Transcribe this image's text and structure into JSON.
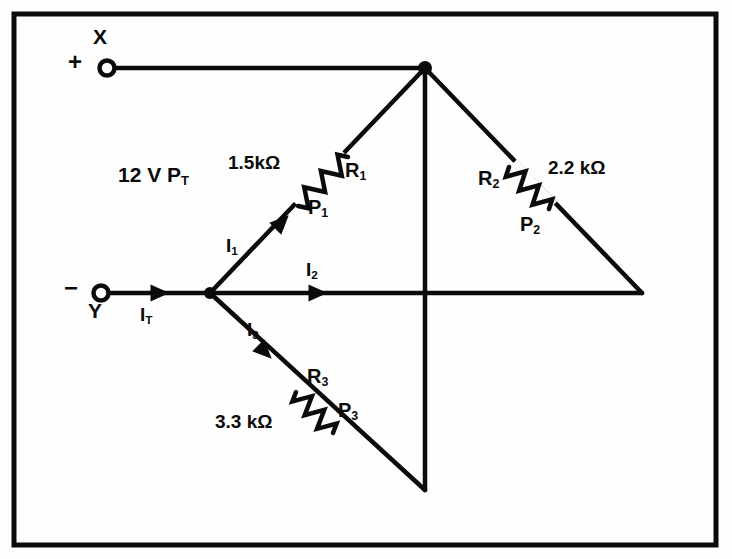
{
  "figure": {
    "colors": {
      "ink": "#0b0b0b",
      "background": "#fefefe",
      "border": "#0b0b0b"
    },
    "border": {
      "x": 14,
      "y": 14,
      "width": 702,
      "height": 531,
      "stroke_width": 5
    }
  },
  "terminals": [
    {
      "id": "x",
      "name": "X",
      "polarity": "+",
      "label": "X",
      "sign": "+",
      "x": 107,
      "y": 68,
      "label_x": 96,
      "label_y": 30,
      "sign_x": 74,
      "sign_y": 55
    },
    {
      "id": "y",
      "name": "Y",
      "polarity": "−",
      "label": "Y",
      "sign": "−",
      "x": 101,
      "y": 293,
      "label_x": 90,
      "label_y": 304,
      "sign_x": 70,
      "sign_y": 280
    }
  ],
  "source": {
    "voltage_label": "12 V P",
    "voltage_sub": "T",
    "full_text": "12 V P_T",
    "x": 118,
    "y": 165
  },
  "nodes": [
    {
      "id": "top-junction",
      "x": 425,
      "y": 68,
      "dot": true,
      "radius": 7
    },
    {
      "id": "left-junction",
      "x": 210,
      "y": 293,
      "dot": true,
      "radius": 6
    },
    {
      "id": "right-vertex",
      "x": 642,
      "y": 293,
      "dot": false,
      "radius": 0
    },
    {
      "id": "bottom-vertex",
      "x": 425,
      "y": 490,
      "dot": false,
      "radius": 0
    }
  ],
  "branches": [
    {
      "id": "branch-1",
      "current_label": "I",
      "current_sub": "1",
      "current_x": 226,
      "current_y": 238,
      "resistor_ref": "R",
      "resistor_sub": "1",
      "resistor_ref_x": 345,
      "resistor_ref_y": 160,
      "power_ref": "P",
      "power_sub": "1",
      "power_ref_x": 308,
      "power_ref_y": 197,
      "value": "1.5kΩ",
      "value_x": 228,
      "value_y": 153,
      "arrow_x": 282,
      "arrow_y": 222,
      "arrow_angle": -45
    },
    {
      "id": "branch-2",
      "current_label": "I",
      "current_sub": "2",
      "current_x": 306,
      "current_y": 262,
      "resistor_ref": "",
      "resistor_sub": "",
      "value": "",
      "arrow_x": 318,
      "arrow_y": 293,
      "arrow_angle": 0
    },
    {
      "id": "branch-3",
      "current_label": "I",
      "current_sub": "3",
      "current_x": 247,
      "current_y": 322,
      "resistor_ref": "R",
      "resistor_sub": "3",
      "resistor_ref_x": 307,
      "resistor_ref_y": 366,
      "power_ref": "P",
      "power_sub": "3",
      "power_ref_x": 338,
      "power_ref_y": 400,
      "value": "3.3 kΩ",
      "value_x": 215,
      "value_y": 412,
      "arrow_x": 265,
      "arrow_y": 352,
      "arrow_angle": 45
    },
    {
      "id": "branch-right",
      "current_label": "",
      "current_sub": "",
      "resistor_ref": "R",
      "resistor_sub": "2",
      "resistor_ref_x": 478,
      "resistor_ref_y": 168,
      "power_ref": "P",
      "power_sub": "2",
      "power_ref_x": 520,
      "power_ref_y": 214,
      "value": "2.2 kΩ",
      "value_x": 548,
      "value_y": 158
    }
  ],
  "total_current": {
    "label": "I",
    "sub": "T",
    "x": 140,
    "y": 308,
    "arrow_x": 160,
    "arrow_y": 293,
    "arrow_angle": 0
  },
  "wires": [
    {
      "id": "wire-x-to-top",
      "from": [
        113,
        68
      ],
      "to": [
        425,
        68
      ]
    },
    {
      "id": "wire-y-to-node",
      "from": [
        110,
        293
      ],
      "to": [
        210,
        293
      ]
    },
    {
      "id": "wire-branch1",
      "from": [
        210,
        293
      ],
      "to": [
        425,
        68
      ]
    },
    {
      "id": "wire-branch2",
      "from": [
        210,
        293
      ],
      "to": [
        642,
        293
      ]
    },
    {
      "id": "wire-branch3",
      "from": [
        210,
        293
      ],
      "to": [
        425,
        490
      ]
    },
    {
      "id": "wire-top-to-right",
      "from": [
        425,
        68
      ],
      "to": [
        642,
        293
      ]
    },
    {
      "id": "wire-top-to-bottom",
      "from": [
        425,
        68
      ],
      "to": [
        425,
        490
      ]
    }
  ],
  "resistors": [
    {
      "id": "resistor-r1",
      "from": [
        298,
        206
      ],
      "to": [
        348,
        157
      ],
      "zigs": 6
    },
    {
      "id": "resistor-r2",
      "from": [
        509,
        167
      ],
      "to": [
        549,
        209
      ],
      "zigs": 6
    },
    {
      "id": "resistor-r3",
      "from": [
        296,
        392
      ],
      "to": [
        333,
        433
      ],
      "zigs": 6
    }
  ]
}
